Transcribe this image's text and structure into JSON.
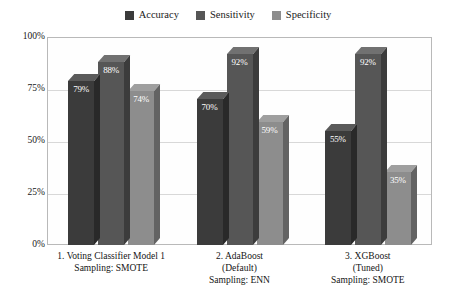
{
  "chart_data": {
    "type": "bar",
    "title": "",
    "xlabel": "",
    "ylabel": "",
    "ylim": [
      0,
      100
    ],
    "grid": true,
    "legend_position": "top-center",
    "categories": [
      "1. Voting Classifier Model 1\nSampling: SMOTE",
      "2. AdaBoost\n(Default)\nSampling: ENN",
      "3. XGBoost\n(Tuned)\nSampling: SMOTE"
    ],
    "category_lines": [
      [
        "1. Voting Classifier Model 1",
        "Sampling: SMOTE"
      ],
      [
        "2. AdaBoost",
        "(Default)",
        "Sampling: ENN"
      ],
      [
        "3. XGBoost",
        "(Tuned)",
        "Sampling: SMOTE"
      ]
    ],
    "series": [
      {
        "name": "Accuracy",
        "color": "#3b3b3b",
        "values": [
          79,
          70,
          55
        ],
        "labels": [
          "79%",
          "70%",
          "55%"
        ]
      },
      {
        "name": "Sensitivity",
        "color": "#565656",
        "values": [
          88,
          92,
          92
        ],
        "labels": [
          "88%",
          "92%",
          "92%"
        ]
      },
      {
        "name": "Specificity",
        "color": "#8d8d8d",
        "values": [
          74,
          59,
          35
        ],
        "labels": [
          "74%",
          "59%",
          "35%"
        ]
      }
    ],
    "yticks": [
      {
        "value": 100,
        "label": "100%"
      },
      {
        "value": 75,
        "label": "75%"
      },
      {
        "value": 50,
        "label": "50%"
      },
      {
        "value": 25,
        "label": "25%"
      },
      {
        "value": 0,
        "label": "0%"
      }
    ]
  },
  "colors": {
    "accuracy": "#3b3b3b",
    "sensitivity": "#565656",
    "specificity": "#8d8d8d",
    "gridline": "#d8d8d8",
    "frame": "#b9b9b9",
    "background": "#ffffff"
  }
}
